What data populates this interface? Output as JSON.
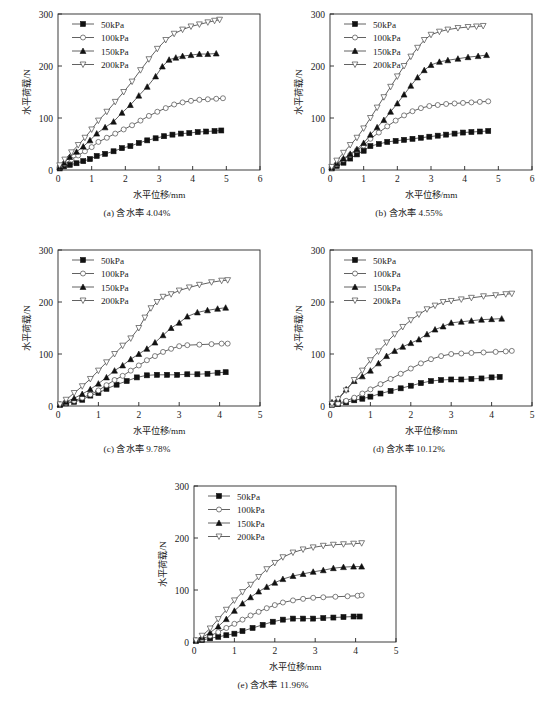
{
  "figure": {
    "axis_x_title": "水平位移/mm",
    "axis_y_title": "水平荷载/N",
    "legend_labels": [
      "50kPa",
      "100kPa",
      "150kPa",
      "200kPa"
    ],
    "marker_names": [
      "filled-square",
      "open-circle",
      "filled-triangle-up",
      "open-triangle-down"
    ],
    "captions": {
      "a": "(a) 含水率 4.04%",
      "b": "(b) 含水率 4.55%",
      "c": "(c) 含水率 9.78%",
      "d": "(d) 含水率 10.12%",
      "e": "(e) 含水率 11.96%"
    }
  },
  "chart_data": [
    {
      "id": "a",
      "type": "line",
      "title": "(a) 含水率 4.04%",
      "xlabel": "水平位移/mm",
      "ylabel": "水平荷载/N",
      "xlim": [
        0,
        6
      ],
      "ylim": [
        0,
        300
      ],
      "xticks": [
        0,
        1,
        2,
        3,
        4,
        5,
        6
      ],
      "yticks": [
        0,
        100,
        200,
        300
      ],
      "grid": false,
      "legend_position": "top-left",
      "series": [
        {
          "name": "50kPa",
          "marker": "filled-square",
          "x": [
            0.05,
            0.18,
            0.35,
            0.55,
            0.75,
            0.95,
            1.15,
            1.4,
            1.65,
            1.9,
            2.15,
            2.4,
            2.65,
            2.9,
            3.15,
            3.4,
            3.65,
            3.9,
            4.15,
            4.4,
            4.65,
            4.85
          ],
          "y": [
            3,
            7,
            10,
            13,
            17,
            21,
            27,
            31,
            36,
            42,
            46,
            52,
            57,
            61,
            65,
            68,
            70,
            71,
            73,
            74,
            75,
            76
          ]
        },
        {
          "name": "100kPa",
          "marker": "open-circle",
          "x": [
            0.05,
            0.2,
            0.4,
            0.6,
            0.8,
            1.0,
            1.2,
            1.45,
            1.7,
            1.95,
            2.2,
            2.45,
            2.7,
            2.95,
            3.2,
            3.45,
            3.7,
            3.95,
            4.2,
            4.45,
            4.7,
            4.9
          ],
          "y": [
            5,
            12,
            20,
            28,
            36,
            44,
            54,
            62,
            70,
            78,
            86,
            95,
            104,
            112,
            119,
            126,
            130,
            133,
            135,
            136,
            137,
            138
          ]
        },
        {
          "name": "150kPa",
          "marker": "filled-triangle-up",
          "x": [
            0.05,
            0.18,
            0.35,
            0.55,
            0.75,
            0.95,
            1.15,
            1.4,
            1.65,
            1.9,
            2.15,
            2.4,
            2.65,
            2.9,
            3.1,
            3.3,
            3.5,
            3.7,
            3.95,
            4.2,
            4.45,
            4.7
          ],
          "y": [
            6,
            14,
            25,
            35,
            45,
            57,
            70,
            82,
            93,
            110,
            125,
            143,
            160,
            180,
            199,
            212,
            216,
            219,
            221,
            223,
            223,
            224
          ]
        },
        {
          "name": "200kPa",
          "marker": "open-triangle-down",
          "x": [
            0.05,
            0.2,
            0.4,
            0.6,
            0.8,
            1.0,
            1.2,
            1.45,
            1.7,
            1.95,
            2.2,
            2.45,
            2.7,
            2.95,
            3.2,
            3.45,
            3.7,
            3.95,
            4.2,
            4.45,
            4.65,
            4.8
          ],
          "y": [
            9,
            20,
            34,
            48,
            62,
            78,
            95,
            112,
            131,
            150,
            170,
            192,
            213,
            233,
            250,
            262,
            270,
            276,
            280,
            284,
            287,
            289
          ]
        }
      ]
    },
    {
      "id": "b",
      "type": "line",
      "title": "(b) 含水率 4.55%",
      "xlabel": "水平位移/mm",
      "ylabel": "水平荷载/N",
      "xlim": [
        0,
        6
      ],
      "ylim": [
        0,
        300
      ],
      "xticks": [
        0,
        1,
        2,
        3,
        4,
        5,
        6
      ],
      "yticks": [
        0,
        100,
        200,
        300
      ],
      "grid": false,
      "legend_position": "top-left",
      "series": [
        {
          "name": "50kPa",
          "marker": "filled-square",
          "x": [
            0.05,
            0.2,
            0.4,
            0.6,
            0.8,
            1.0,
            1.2,
            1.45,
            1.7,
            1.95,
            2.2,
            2.45,
            2.7,
            2.95,
            3.2,
            3.45,
            3.7,
            3.95,
            4.2,
            4.45,
            4.7
          ],
          "y": [
            3,
            8,
            14,
            22,
            30,
            37,
            46,
            50,
            54,
            56,
            58,
            60,
            62,
            64,
            66,
            68,
            70,
            72,
            73,
            74,
            75
          ]
        },
        {
          "name": "100kPa",
          "marker": "open-circle",
          "x": [
            0.05,
            0.2,
            0.4,
            0.6,
            0.8,
            1.0,
            1.2,
            1.45,
            1.7,
            1.95,
            2.2,
            2.45,
            2.7,
            2.95,
            3.2,
            3.45,
            3.7,
            3.95,
            4.2,
            4.45,
            4.7
          ],
          "y": [
            4,
            11,
            20,
            29,
            38,
            47,
            60,
            72,
            84,
            95,
            105,
            113,
            119,
            123,
            125,
            127,
            128,
            129,
            130,
            131,
            132
          ]
        },
        {
          "name": "150kPa",
          "marker": "filled-triangle-up",
          "x": [
            0.05,
            0.2,
            0.4,
            0.6,
            0.8,
            1.0,
            1.2,
            1.4,
            1.6,
            1.8,
            2.0,
            2.2,
            2.4,
            2.6,
            2.8,
            3.0,
            3.25,
            3.5,
            3.8,
            4.1,
            4.4,
            4.65
          ],
          "y": [
            5,
            13,
            22,
            31,
            40,
            52,
            68,
            82,
            96,
            112,
            128,
            145,
            162,
            178,
            192,
            202,
            208,
            211,
            214,
            217,
            219,
            221
          ]
        },
        {
          "name": "200kPa",
          "marker": "open-triangle-down",
          "x": [
            0.05,
            0.2,
            0.4,
            0.6,
            0.8,
            1.0,
            1.2,
            1.4,
            1.6,
            1.8,
            2.0,
            2.2,
            2.4,
            2.6,
            2.8,
            3.0,
            3.25,
            3.5,
            3.8,
            4.1,
            4.35,
            4.55
          ],
          "y": [
            6,
            18,
            33,
            48,
            62,
            80,
            100,
            120,
            140,
            160,
            180,
            200,
            218,
            235,
            250,
            260,
            266,
            270,
            273,
            275,
            276,
            277
          ]
        }
      ]
    },
    {
      "id": "c",
      "type": "line",
      "title": "(c) 含水率 9.78%",
      "xlabel": "水平位移/mm",
      "ylabel": "水平荷载/N",
      "xlim": [
        0,
        5
      ],
      "ylim": [
        0,
        300
      ],
      "xticks": [
        0,
        1,
        2,
        3,
        4,
        5
      ],
      "yticks": [
        0,
        100,
        200,
        300
      ],
      "grid": false,
      "legend_position": "top-left",
      "series": [
        {
          "name": "50kPa",
          "marker": "filled-square",
          "x": [
            0.05,
            0.2,
            0.4,
            0.6,
            0.8,
            1.0,
            1.2,
            1.45,
            1.7,
            1.95,
            2.2,
            2.45,
            2.7,
            2.95,
            3.2,
            3.45,
            3.7,
            3.95,
            4.15
          ],
          "y": [
            2,
            5,
            8,
            12,
            20,
            25,
            33,
            41,
            48,
            55,
            59,
            60,
            60,
            60,
            61,
            61,
            62,
            64,
            65
          ]
        },
        {
          "name": "100kPa",
          "marker": "open-circle",
          "x": [
            0.05,
            0.2,
            0.4,
            0.6,
            0.8,
            1.0,
            1.2,
            1.4,
            1.6,
            1.8,
            2.0,
            2.2,
            2.4,
            2.6,
            2.8,
            3.0,
            3.2,
            3.5,
            3.8,
            4.05,
            4.2
          ],
          "y": [
            2,
            6,
            10,
            16,
            22,
            30,
            40,
            50,
            58,
            68,
            78,
            88,
            96,
            104,
            110,
            115,
            117,
            118,
            119,
            120,
            120
          ]
        },
        {
          "name": "150kPa",
          "marker": "filled-triangle-up",
          "x": [
            0.05,
            0.2,
            0.4,
            0.6,
            0.8,
            1.0,
            1.2,
            1.4,
            1.6,
            1.8,
            2.0,
            2.2,
            2.4,
            2.6,
            2.8,
            3.0,
            3.2,
            3.45,
            3.7,
            3.95,
            4.15
          ],
          "y": [
            3,
            8,
            15,
            23,
            32,
            43,
            55,
            68,
            78,
            90,
            100,
            110,
            122,
            136,
            150,
            160,
            172,
            180,
            184,
            187,
            189
          ]
        },
        {
          "name": "200kPa",
          "marker": "open-triangle-down",
          "x": [
            0.05,
            0.2,
            0.4,
            0.6,
            0.8,
            1.0,
            1.2,
            1.4,
            1.6,
            1.8,
            2.0,
            2.15,
            2.3,
            2.45,
            2.6,
            2.8,
            3.0,
            3.25,
            3.5,
            3.8,
            4.05,
            4.2
          ],
          "y": [
            3,
            12,
            25,
            38,
            52,
            68,
            84,
            100,
            116,
            130,
            150,
            170,
            188,
            200,
            210,
            215,
            222,
            228,
            233,
            238,
            241,
            242
          ]
        }
      ]
    },
    {
      "id": "d",
      "type": "line",
      "title": "(d) 含水率 10.12%",
      "xlabel": "水平位移/mm",
      "ylabel": "水平荷载/N",
      "xlim": [
        0,
        5
      ],
      "ylim": [
        0,
        300
      ],
      "xticks": [
        0,
        1,
        2,
        3,
        4,
        5
      ],
      "yticks": [
        0,
        100,
        200,
        300
      ],
      "grid": false,
      "legend_position": "top-left",
      "series": [
        {
          "name": "50kPa",
          "marker": "filled-square",
          "x": [
            0.05,
            0.2,
            0.4,
            0.6,
            0.8,
            1.0,
            1.25,
            1.5,
            1.75,
            2.0,
            2.25,
            2.5,
            2.75,
            3.0,
            3.25,
            3.5,
            3.75,
            4.0,
            4.2
          ],
          "y": [
            2,
            4,
            7,
            11,
            14,
            18,
            24,
            29,
            34,
            39,
            44,
            48,
            50,
            51,
            51,
            52,
            53,
            55,
            56
          ]
        },
        {
          "name": "100kPa",
          "marker": "open-circle",
          "x": [
            0.05,
            0.2,
            0.4,
            0.6,
            0.8,
            1.0,
            1.25,
            1.5,
            1.75,
            2.0,
            2.25,
            2.5,
            2.75,
            3.0,
            3.25,
            3.5,
            3.8,
            4.1,
            4.35,
            4.5
          ],
          "y": [
            2,
            5,
            10,
            16,
            24,
            32,
            42,
            52,
            62,
            72,
            82,
            90,
            96,
            100,
            101,
            102,
            103,
            104,
            105,
            106
          ]
        },
        {
          "name": "150kPa",
          "marker": "filled-triangle-up",
          "x": [
            0.05,
            0.2,
            0.4,
            0.6,
            0.8,
            1.0,
            1.2,
            1.4,
            1.6,
            1.8,
            2.0,
            2.2,
            2.4,
            2.6,
            2.8,
            3.0,
            3.25,
            3.5,
            3.75,
            4.0,
            4.25
          ],
          "y": [
            7,
            14,
            32,
            48,
            57,
            68,
            82,
            96,
            106,
            114,
            121,
            128,
            138,
            147,
            153,
            160,
            162,
            164,
            166,
            167,
            168
          ]
        },
        {
          "name": "200kPa",
          "marker": "open-triangle-down",
          "x": [
            0.05,
            0.2,
            0.4,
            0.6,
            0.8,
            1.0,
            1.2,
            1.4,
            1.6,
            1.8,
            2.0,
            2.2,
            2.4,
            2.6,
            2.8,
            3.0,
            3.25,
            3.5,
            3.8,
            4.1,
            4.35,
            4.5
          ],
          "y": [
            4,
            13,
            30,
            50,
            68,
            88,
            105,
            122,
            138,
            152,
            165,
            176,
            186,
            193,
            200,
            202,
            205,
            208,
            211,
            213,
            215,
            216
          ]
        }
      ]
    },
    {
      "id": "e",
      "type": "line",
      "title": "(e) 含水率 11.96%",
      "xlabel": "水平位移/mm",
      "ylabel": "水平荷载/N",
      "xlim": [
        0,
        5
      ],
      "ylim": [
        0,
        300
      ],
      "xticks": [
        0,
        1,
        2,
        3,
        4,
        5
      ],
      "yticks": [
        0,
        100,
        200,
        300
      ],
      "grid": false,
      "legend_position": "top-left",
      "series": [
        {
          "name": "50kPa",
          "marker": "filled-square",
          "x": [
            0.05,
            0.2,
            0.4,
            0.6,
            0.8,
            1.0,
            1.2,
            1.45,
            1.7,
            1.95,
            2.2,
            2.45,
            2.7,
            2.95,
            3.2,
            3.45,
            3.7,
            3.95,
            4.1
          ],
          "y": [
            2,
            4,
            7,
            10,
            13,
            16,
            21,
            27,
            33,
            39,
            43,
            45,
            45,
            45,
            46,
            47,
            48,
            49,
            49
          ]
        },
        {
          "name": "100kPa",
          "marker": "open-circle",
          "x": [
            0.05,
            0.2,
            0.4,
            0.6,
            0.8,
            1.0,
            1.2,
            1.4,
            1.6,
            1.8,
            2.0,
            2.2,
            2.45,
            2.7,
            2.95,
            3.2,
            3.5,
            3.8,
            4.05,
            4.15
          ],
          "y": [
            2,
            6,
            12,
            19,
            27,
            35,
            43,
            51,
            58,
            65,
            71,
            76,
            80,
            83,
            85,
            86,
            87,
            88,
            89,
            90
          ]
        },
        {
          "name": "150kPa",
          "marker": "filled-triangle-up",
          "x": [
            0.05,
            0.2,
            0.4,
            0.6,
            0.8,
            1.0,
            1.2,
            1.4,
            1.6,
            1.8,
            2.0,
            2.2,
            2.45,
            2.7,
            2.95,
            3.2,
            3.45,
            3.7,
            3.95,
            4.15
          ],
          "y": [
            3,
            9,
            18,
            30,
            44,
            60,
            74,
            86,
            97,
            106,
            114,
            121,
            127,
            131,
            135,
            138,
            142,
            144,
            145,
            145
          ]
        },
        {
          "name": "200kPa",
          "marker": "open-triangle-down",
          "x": [
            0.05,
            0.2,
            0.4,
            0.6,
            0.8,
            1.0,
            1.2,
            1.4,
            1.6,
            1.8,
            2.0,
            2.2,
            2.45,
            2.7,
            2.95,
            3.2,
            3.45,
            3.7,
            3.95,
            4.15
          ],
          "y": [
            3,
            12,
            26,
            44,
            62,
            80,
            96,
            110,
            125,
            140,
            152,
            163,
            172,
            178,
            182,
            185,
            187,
            188,
            189,
            190
          ]
        }
      ]
    }
  ]
}
